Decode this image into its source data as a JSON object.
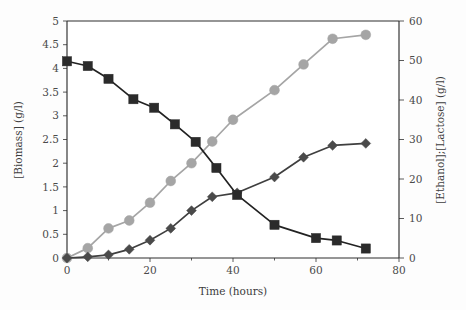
{
  "chart_data": {
    "type": "line",
    "title": "",
    "subtitle": "",
    "xlabel": "Time (hours)",
    "ylabel": "[Biomass] (g/l)",
    "y2label": "[Ethanol];[Lactose] (g/l)",
    "xlim": [
      0,
      80
    ],
    "ylim": [
      0,
      5
    ],
    "y2lim": [
      0,
      60
    ],
    "grid": false,
    "legend_position": "none",
    "x_ticks": [
      0,
      20,
      40,
      60,
      80
    ],
    "x_tick_labels": [
      "0",
      "20",
      "40",
      "60",
      "80"
    ],
    "x_minor_ticks": [
      10,
      30,
      50,
      70
    ],
    "y_ticks": [
      0,
      0.5,
      1,
      1.5,
      2,
      2.5,
      3,
      3.5,
      4,
      4.5,
      5
    ],
    "y_tick_labels": [
      "0",
      "0.5",
      "1",
      "1.5",
      "2",
      "2.5",
      "3",
      "3.5",
      "4",
      "4.5",
      "5"
    ],
    "y2_ticks": [
      0,
      10,
      20,
      30,
      40,
      50,
      60
    ],
    "y2_tick_labels": [
      "0",
      "10",
      "20",
      "30",
      "40",
      "50",
      "60"
    ],
    "series": [
      {
        "name": "Lactose",
        "axis": "right",
        "marker": "circle",
        "color": "#a5a5a5",
        "line_color": "#a5a5a5",
        "x": [
          0,
          5,
          10,
          15,
          20,
          25,
          30,
          35,
          40,
          50,
          57,
          64,
          72
        ],
        "values": [
          0,
          2.5,
          7.5,
          9.5,
          14,
          19.5,
          24,
          29.5,
          35,
          42.5,
          49,
          55.5,
          56.5
        ]
      },
      {
        "name": "Biomass",
        "axis": "left",
        "marker": "square",
        "color": "#2b2b2b",
        "line_color": "#222222",
        "x": [
          0,
          5,
          10,
          16,
          21,
          26,
          31,
          36,
          41,
          50,
          60,
          65,
          72
        ],
        "values": [
          4.15,
          4.05,
          3.78,
          3.35,
          3.17,
          2.82,
          2.45,
          1.9,
          1.33,
          0.7,
          0.42,
          0.37,
          0.2
        ]
      },
      {
        "name": "Ethanol",
        "axis": "right",
        "marker": "diamond",
        "color": "#4a4a4a",
        "line_color": "#3f3f3f",
        "x": [
          0,
          5,
          10,
          15,
          20,
          25,
          30,
          35,
          41,
          50,
          57,
          64,
          72
        ],
        "values": [
          0,
          0.3,
          0.8,
          2.2,
          4.5,
          7.5,
          12,
          15.5,
          16.5,
          20.5,
          25.5,
          28.5,
          29
        ]
      }
    ]
  },
  "figure": {
    "x_axis_title": "Time (hours)",
    "y_left_axis_title": "[Biomass] (g/l)",
    "y_right_axis_title": "[Ethanol];[Lactose] (g/l)"
  }
}
